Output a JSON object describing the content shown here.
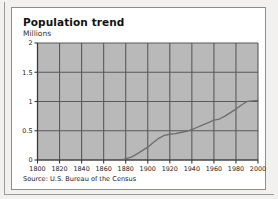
{
  "figure": {
    "title": "Population trend",
    "unit_label": "Millions",
    "source": "Source: U.S. Bureau of the Census"
  },
  "chart_data": {
    "type": "line",
    "title": "Population trend",
    "subtitle": "Millions",
    "xlabel": "",
    "ylabel": "Millions",
    "xlim": [
      1800,
      2000
    ],
    "ylim": [
      0,
      2
    ],
    "grid": true,
    "legend": false,
    "plot_background": "#b9b9b9",
    "grid_color": "#5a5a5a",
    "line_color": "#6d6d6d",
    "xticks": [
      1800,
      1820,
      1840,
      1860,
      1880,
      1900,
      1920,
      1940,
      1960,
      1980,
      2000
    ],
    "xtick_labels": [
      "1800",
      "1820",
      "1840",
      "1860",
      "1880",
      "1900",
      "1920",
      "1940",
      "1960",
      "1980",
      "2000"
    ],
    "yticks": [
      0,
      0.5,
      1,
      1.5,
      2
    ],
    "ytick_labels": [
      "0",
      "0.5",
      "1",
      "1.5",
      "2"
    ],
    "series": [
      {
        "name": "Population",
        "x": [
          1878,
          1885,
          1890,
          1895,
          1900,
          1905,
          1910,
          1915,
          1920,
          1925,
          1930,
          1935,
          1940,
          1945,
          1950,
          1955,
          1960,
          1965,
          1970,
          1975,
          1980,
          1985,
          1990,
          1995,
          2000
        ],
        "values": [
          0.01,
          0.05,
          0.1,
          0.16,
          0.22,
          0.3,
          0.37,
          0.42,
          0.44,
          0.45,
          0.47,
          0.49,
          0.52,
          0.56,
          0.6,
          0.64,
          0.68,
          0.7,
          0.75,
          0.81,
          0.87,
          0.94,
          1.0,
          1.01,
          1.02
        ]
      }
    ]
  }
}
